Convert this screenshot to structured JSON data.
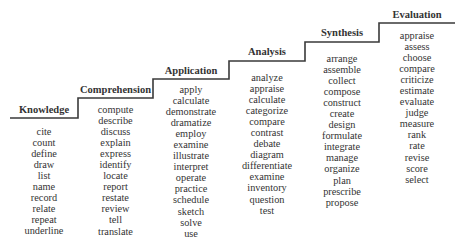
{
  "diagram": {
    "type": "staircase",
    "line_color": "#3a3a3a",
    "levels": [
      {
        "title": "Knowledge",
        "verbs": [
          "cite",
          "count",
          "define",
          "draw",
          "list",
          "name",
          "record",
          "relate",
          "repeat",
          "underline"
        ]
      },
      {
        "title": "Comprehension",
        "verbs": [
          "compute",
          "describe",
          "discuss",
          "explain",
          "express",
          "identify",
          "locate",
          "report",
          "restate",
          "review",
          "tell",
          "translate"
        ]
      },
      {
        "title": "Application",
        "verbs": [
          "apply",
          "calculate",
          "demonstrate",
          "dramatize",
          "employ",
          "examine",
          "illustrate",
          "interpret",
          "operate",
          "practice",
          "schedule",
          "sketch",
          "solve",
          "use"
        ]
      },
      {
        "title": "Analysis",
        "verbs": [
          "analyze",
          "appraise",
          "calculate",
          "categorize",
          "compare",
          "contrast",
          "debate",
          "diagram",
          "differentiate",
          "examine",
          "inventory",
          "question",
          "test"
        ]
      },
      {
        "title": "Synthesis",
        "verbs": [
          "arrange",
          "assemble",
          "collect",
          "compose",
          "construct",
          "create",
          "design",
          "formulate",
          "integrate",
          "manage",
          "organize",
          "plan",
          "prescribe",
          "propose"
        ]
      },
      {
        "title": "Evaluation",
        "verbs": [
          "appraise",
          "assess",
          "choose",
          "compare",
          "criticize",
          "estimate",
          "evaluate",
          "judge",
          "measure",
          "rank",
          "rate",
          "revise",
          "score",
          "select"
        ]
      }
    ]
  }
}
